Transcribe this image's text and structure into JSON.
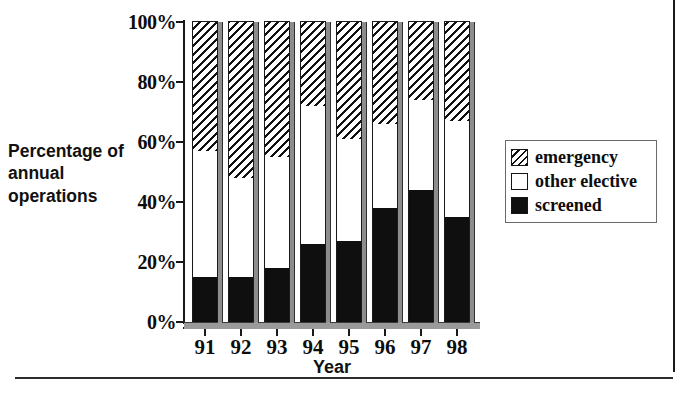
{
  "chart_data": {
    "type": "bar",
    "subtype": "stacked-percentage",
    "title": "",
    "xlabel": "Year",
    "ylabel": "Percentage of annual operations",
    "categories": [
      "91",
      "92",
      "93",
      "94",
      "95",
      "96",
      "97",
      "98"
    ],
    "ylim": [
      0,
      100
    ],
    "ytick_values": [
      0,
      20,
      40,
      60,
      80,
      100
    ],
    "ytick_labels": [
      "0%",
      "20%",
      "40%",
      "60%",
      "80%",
      "100%"
    ],
    "grid": false,
    "legend_position": "right",
    "series": [
      {
        "name": "screened",
        "values": [
          15,
          15,
          18,
          26,
          27,
          38,
          44,
          35
        ]
      },
      {
        "name": "other elective",
        "values": [
          42,
          33,
          37,
          46,
          34,
          28,
          30,
          32
        ]
      },
      {
        "name": "emergency",
        "values": [
          43,
          52,
          45,
          28,
          39,
          34,
          26,
          33
        ]
      }
    ],
    "cumulative_tops": {
      "screened": [
        15,
        15,
        18,
        26,
        27,
        38,
        44,
        35
      ],
      "other_elective": [
        57,
        48,
        55,
        72,
        61,
        66,
        74,
        67
      ],
      "emergency": [
        100,
        100,
        100,
        100,
        100,
        100,
        100,
        100
      ]
    }
  },
  "axes": {
    "y_title": "Percentage of annual operations",
    "x_title": "Year",
    "y_ticks": [
      "100%",
      "80%",
      "60%",
      "40%",
      "20%",
      "0%"
    ],
    "x_ticks": [
      "91",
      "92",
      "93",
      "94",
      "95",
      "96",
      "97",
      "98"
    ]
  },
  "legend": {
    "items": [
      {
        "label": "emergency",
        "pattern": "diagonal-hatch",
        "color": "#111111"
      },
      {
        "label": "other elective",
        "pattern": "solid-fill",
        "color": "#ffffff"
      },
      {
        "label": "screened",
        "pattern": "solid-fill",
        "color": "#100f0f"
      }
    ]
  },
  "colors": {
    "axis": "#1a1a1a",
    "bar_side": "#8d8d8d",
    "screened": "#100f0f",
    "elective": "#ffffff",
    "emergency_hatch": "#111111",
    "rule": "#2b2b2b"
  }
}
